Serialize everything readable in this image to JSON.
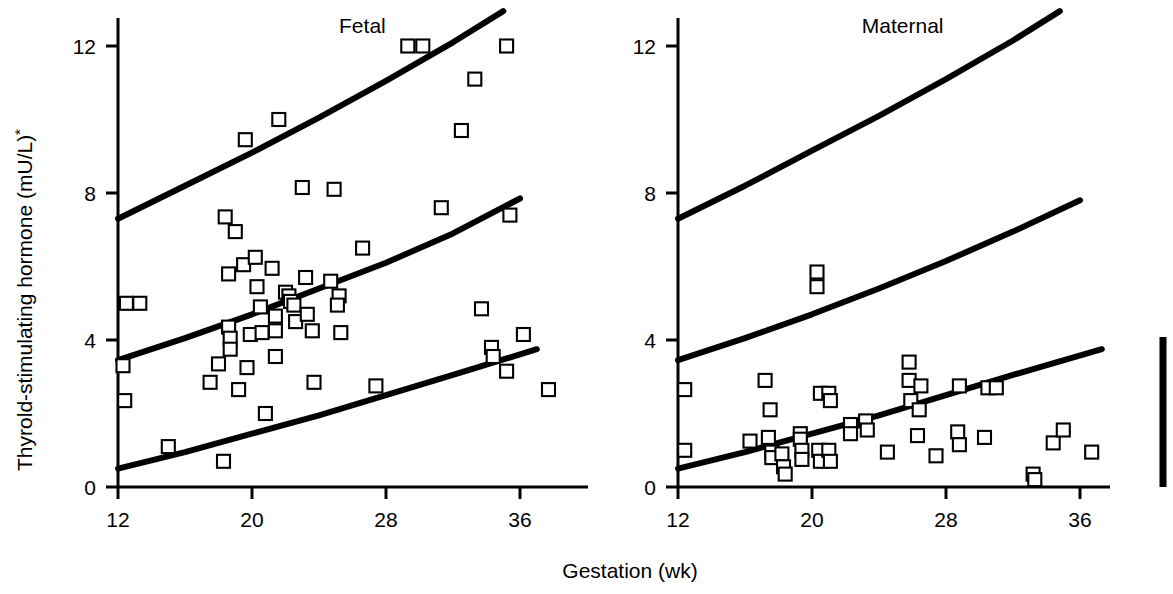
{
  "figure": {
    "y_axis_label": "Thyrold-stimulating hormone (mU/L)",
    "y_axis_label_superscript": "*",
    "x_axis_label": "Gestation (wk)",
    "y_ticks": [
      "0",
      "4",
      "8",
      "12"
    ],
    "x_ticks": [
      "12",
      "20",
      "28",
      "36"
    ],
    "panels": [
      {
        "title": "Fetal"
      },
      {
        "title": "Maternal"
      }
    ],
    "scale_bar_name": "vertical-reference-bar"
  },
  "chart_data": {
    "type": "scatter",
    "title": "",
    "xlabel": "Gestation (wk)",
    "ylabel": "Thyrold-stimulating hormone (mU/L)*",
    "xlim": [
      11.0,
      39.5
    ],
    "ylim": [
      0,
      13.2
    ],
    "xticks": [
      12,
      20,
      28,
      36
    ],
    "yticks": [
      0,
      4,
      8,
      12
    ],
    "grid": false,
    "legend": "none",
    "panels": [
      {
        "name": "Fetal",
        "marker": "open-square",
        "points": [
          [
            12.3,
            3.3
          ],
          [
            12.5,
            5.0
          ],
          [
            13.3,
            5.0
          ],
          [
            12.4,
            2.35
          ],
          [
            15.0,
            1.1
          ],
          [
            17.5,
            2.85
          ],
          [
            18.0,
            3.35
          ],
          [
            18.3,
            0.7
          ],
          [
            18.4,
            7.35
          ],
          [
            18.6,
            5.8
          ],
          [
            18.6,
            4.35
          ],
          [
            18.7,
            4.05
          ],
          [
            18.7,
            3.75
          ],
          [
            19.0,
            6.95
          ],
          [
            19.2,
            2.65
          ],
          [
            19.5,
            6.05
          ],
          [
            19.6,
            9.45
          ],
          [
            19.7,
            3.25
          ],
          [
            19.9,
            4.15
          ],
          [
            20.2,
            6.25
          ],
          [
            20.3,
            5.45
          ],
          [
            20.5,
            4.9
          ],
          [
            20.6,
            4.2
          ],
          [
            20.8,
            2.0
          ],
          [
            21.2,
            5.95
          ],
          [
            21.4,
            4.65
          ],
          [
            21.4,
            4.25
          ],
          [
            21.4,
            3.55
          ],
          [
            21.6,
            10.0
          ],
          [
            22.0,
            5.3
          ],
          [
            22.2,
            5.2
          ],
          [
            22.3,
            5.05
          ],
          [
            22.5,
            4.95
          ],
          [
            22.6,
            4.5
          ],
          [
            23.0,
            8.15
          ],
          [
            23.2,
            5.7
          ],
          [
            23.3,
            4.7
          ],
          [
            23.6,
            4.25
          ],
          [
            23.7,
            2.85
          ],
          [
            24.7,
            5.6
          ],
          [
            24.9,
            8.1
          ],
          [
            25.2,
            5.2
          ],
          [
            25.1,
            4.95
          ],
          [
            25.3,
            4.2
          ],
          [
            26.6,
            6.5
          ],
          [
            27.4,
            2.75
          ],
          [
            29.3,
            12.0
          ],
          [
            30.2,
            12.0
          ],
          [
            31.3,
            7.6
          ],
          [
            32.5,
            9.7
          ],
          [
            33.3,
            11.1
          ],
          [
            33.7,
            4.85
          ],
          [
            34.3,
            3.8
          ],
          [
            34.4,
            3.55
          ],
          [
            35.2,
            12.0
          ],
          [
            35.4,
            7.4
          ],
          [
            35.2,
            3.15
          ],
          [
            36.2,
            4.15
          ],
          [
            37.7,
            2.65
          ]
        ],
        "curves": [
          {
            "name": "upper-reference-curve",
            "label": "97.5th centile",
            "points": [
              [
                12.0,
                7.3
              ],
              [
                16.0,
                8.2
              ],
              [
                20.0,
                9.1
              ],
              [
                24.0,
                10.05
              ],
              [
                28.0,
                11.05
              ],
              [
                32.0,
                12.1
              ],
              [
                35.0,
                12.95
              ]
            ]
          },
          {
            "name": "median-reference-curve",
            "label": "50th centile",
            "points": [
              [
                12.0,
                3.45
              ],
              [
                16.0,
                4.05
              ],
              [
                20.0,
                4.7
              ],
              [
                24.0,
                5.4
              ],
              [
                28.0,
                6.1
              ],
              [
                32.0,
                6.9
              ],
              [
                36.0,
                7.85
              ]
            ]
          },
          {
            "name": "lower-reference-curve",
            "label": "2.5th centile",
            "points": [
              [
                12.0,
                0.5
              ],
              [
                16.0,
                0.95
              ],
              [
                20.0,
                1.45
              ],
              [
                24.0,
                1.95
              ],
              [
                28.0,
                2.5
              ],
              [
                32.0,
                3.05
              ],
              [
                37.0,
                3.75
              ]
            ]
          }
        ]
      },
      {
        "name": "Maternal",
        "marker": "open-square",
        "points": [
          [
            12.4,
            2.65
          ],
          [
            12.4,
            1.0
          ],
          [
            16.3,
            1.25
          ],
          [
            17.2,
            2.9
          ],
          [
            17.4,
            1.35
          ],
          [
            17.6,
            0.95
          ],
          [
            17.6,
            0.8
          ],
          [
            18.2,
            0.9
          ],
          [
            17.5,
            2.1
          ],
          [
            18.3,
            0.55
          ],
          [
            18.4,
            0.35
          ],
          [
            19.3,
            1.45
          ],
          [
            19.3,
            1.3
          ],
          [
            19.4,
            1.0
          ],
          [
            19.4,
            0.75
          ],
          [
            20.3,
            5.85
          ],
          [
            20.3,
            5.45
          ],
          [
            20.5,
            2.55
          ],
          [
            20.4,
            1.0
          ],
          [
            20.5,
            0.7
          ],
          [
            21.0,
            2.55
          ],
          [
            21.1,
            2.35
          ],
          [
            21.0,
            1.0
          ],
          [
            21.1,
            0.7
          ],
          [
            22.3,
            1.7
          ],
          [
            22.3,
            1.45
          ],
          [
            23.2,
            1.8
          ],
          [
            23.3,
            1.55
          ],
          [
            24.5,
            0.95
          ],
          [
            25.8,
            3.4
          ],
          [
            25.8,
            2.9
          ],
          [
            25.9,
            2.35
          ],
          [
            26.5,
            2.75
          ],
          [
            26.4,
            2.1
          ],
          [
            26.3,
            1.4
          ],
          [
            27.4,
            0.85
          ],
          [
            28.8,
            2.75
          ],
          [
            28.7,
            1.5
          ],
          [
            28.8,
            1.15
          ],
          [
            30.5,
            2.7
          ],
          [
            31.0,
            2.7
          ],
          [
            30.3,
            1.35
          ],
          [
            33.2,
            0.35
          ],
          [
            33.3,
            0.2
          ],
          [
            34.4,
            1.2
          ],
          [
            35.0,
            1.55
          ],
          [
            36.7,
            0.95
          ]
        ],
        "curves": [
          {
            "name": "upper-reference-curve",
            "label": "97.5th centile",
            "points": [
              [
                12.0,
                7.3
              ],
              [
                16.0,
                8.2
              ],
              [
                20.0,
                9.15
              ],
              [
                24.0,
                10.1
              ],
              [
                28.0,
                11.1
              ],
              [
                32.0,
                12.15
              ],
              [
                34.8,
                12.95
              ]
            ]
          },
          {
            "name": "median-reference-curve",
            "label": "50th centile",
            "points": [
              [
                12.0,
                3.45
              ],
              [
                16.0,
                4.05
              ],
              [
                20.0,
                4.7
              ],
              [
                24.0,
                5.4
              ],
              [
                28.0,
                6.15
              ],
              [
                32.0,
                6.95
              ],
              [
                36.0,
                7.8
              ]
            ]
          },
          {
            "name": "lower-reference-curve",
            "label": "2.5th centile",
            "points": [
              [
                12.0,
                0.5
              ],
              [
                16.0,
                0.95
              ],
              [
                20.0,
                1.45
              ],
              [
                24.0,
                1.95
              ],
              [
                28.0,
                2.5
              ],
              [
                32.0,
                3.05
              ],
              [
                37.3,
                3.75
              ]
            ]
          }
        ]
      }
    ]
  }
}
